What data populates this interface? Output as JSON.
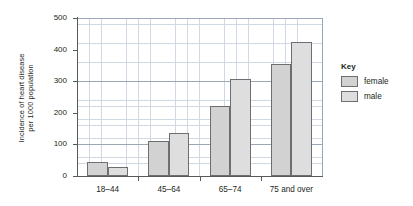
{
  "chart_data": {
    "type": "bar",
    "title": "",
    "xlabel": "",
    "ylabel": "Incidence of heart disease per 1000 population",
    "ylabel_line1": "Incidence of heart disease",
    "ylabel_line2": "per 1000 population",
    "categories": [
      "18–44",
      "45–64",
      "65–74",
      "75 and over"
    ],
    "series": [
      {
        "name": "female",
        "values": [
          45,
          110,
          220,
          355
        ],
        "color": "#d2d2d2"
      },
      {
        "name": "male",
        "values": [
          30,
          136,
          308,
          425
        ],
        "color": "#dedede"
      }
    ],
    "ylim": [
      0,
      500
    ],
    "yticks": [
      0,
      100,
      200,
      300,
      400,
      500
    ],
    "ytick_labels": [
      "0",
      "100",
      "200",
      "300",
      "400",
      "500"
    ],
    "grid": true,
    "grid_major_step": 100,
    "grid_minor_step": 20,
    "legend_position": "right",
    "legend_title": "Key",
    "legend_entries": [
      "female",
      "male"
    ]
  },
  "legend": {
    "title": "Key",
    "items": [
      {
        "label": "female"
      },
      {
        "label": "male"
      }
    ]
  },
  "colors": {
    "female": "#d2d2d2",
    "male": "#dedede",
    "bar_border": "#6d6e70",
    "axis": "#58595b",
    "grid_minor": "#cfd8e4",
    "grid_major": "#9aa7b6",
    "text": "#231f20",
    "background": "#ffffff"
  }
}
